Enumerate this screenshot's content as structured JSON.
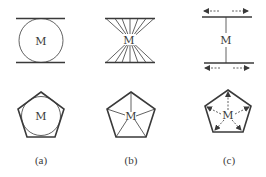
{
  "figure": {
    "panels": [
      {
        "id": "a",
        "caption": "(a)",
        "top": {
          "type": "circle-between-plates",
          "center_label": "M"
        },
        "bottom": {
          "type": "circle-inscribed-in-pentagon",
          "center_label": "M"
        }
      },
      {
        "id": "b",
        "caption": "(b)",
        "top": {
          "type": "rays-between-plates",
          "center_label": "M"
        },
        "bottom": {
          "type": "pentagon-with-spokes",
          "center_label": "M"
        }
      },
      {
        "id": "c",
        "caption": "(c)",
        "top": {
          "type": "stem-between-plates-with-arrows",
          "center_label": "M"
        },
        "bottom": {
          "type": "pentagon-with-dashed-arrows",
          "center_label": "M"
        }
      }
    ],
    "colors": {
      "stroke": "#3a3a3a",
      "background": "#ffffff"
    }
  }
}
